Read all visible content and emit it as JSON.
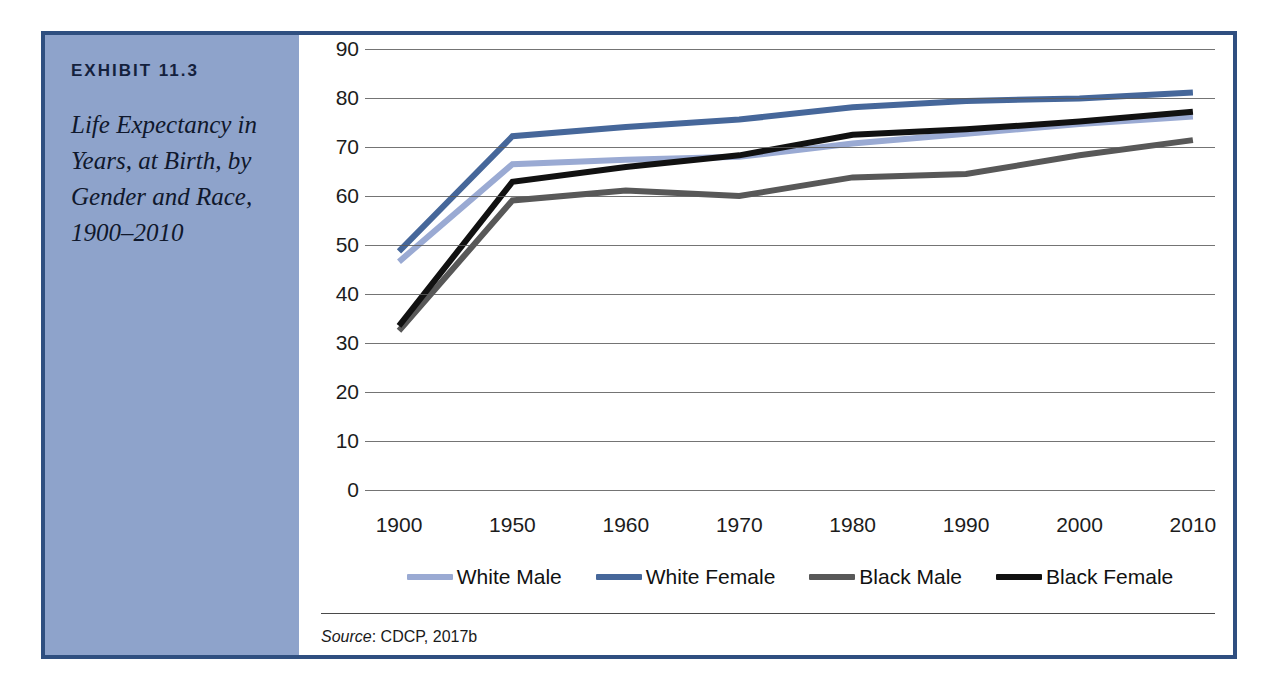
{
  "exhibit": {
    "label": "EXHIBIT 11.3",
    "title": "Life Expectancy in Years, at Birth, by Gender and Race, 1900–2010"
  },
  "source": {
    "prefix": "Source",
    "separator": ": ",
    "text": "CDCP, 2017b"
  },
  "colors": {
    "frame_border": "#2f4f80",
    "caption_panel": "#8ea3cb",
    "white_male": "#9aaad3",
    "white_female": "#46679a",
    "black_male": "#585858",
    "black_female": "#111111",
    "gridline": "#5c5c5c",
    "plot_background": "#ffffff"
  },
  "chart_data": {
    "type": "line",
    "title": "Life Expectancy in Years, at Birth, by Gender and Race, 1900–2010",
    "xlabel": "",
    "ylabel": "",
    "categories": [
      "1900",
      "1950",
      "1960",
      "1970",
      "1980",
      "1990",
      "2000",
      "2010"
    ],
    "ylim": [
      0,
      90
    ],
    "yticks": [
      0,
      10,
      20,
      30,
      40,
      50,
      60,
      70,
      80,
      90
    ],
    "grid": true,
    "legend_position": "bottom",
    "series": [
      {
        "name": "White Male",
        "color": "#9aaad3",
        "values": [
          46.6,
          66.5,
          67.4,
          68.0,
          70.7,
          72.7,
          74.7,
          76.2
        ]
      },
      {
        "name": "White Female",
        "color": "#46679a",
        "values": [
          48.7,
          72.2,
          74.1,
          75.6,
          78.1,
          79.4,
          79.9,
          81.1
        ]
      },
      {
        "name": "Black Male",
        "color": "#585858",
        "values": [
          32.5,
          59.1,
          61.1,
          60.0,
          63.8,
          64.5,
          68.3,
          71.4
        ]
      },
      {
        "name": "Black Female",
        "color": "#111111",
        "values": [
          33.5,
          62.9,
          65.9,
          68.3,
          72.5,
          73.6,
          75.2,
          77.2
        ]
      }
    ]
  }
}
